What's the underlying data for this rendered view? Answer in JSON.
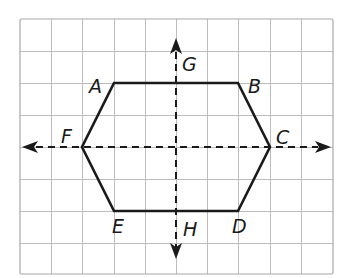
{
  "diagram": {
    "type": "hexagon-on-grid-with-lines-of-symmetry",
    "grid": {
      "columns": 10,
      "rows": 8,
      "line_color": "#b8b8b8",
      "outline_color": "#a0a0a0"
    },
    "hexagon": {
      "stroke_color": "#1a1a1a",
      "vertices": [
        {
          "name": "A",
          "x": 114,
          "y": 83
        },
        {
          "name": "B",
          "x": 238,
          "y": 83
        },
        {
          "name": "C",
          "x": 270,
          "y": 147
        },
        {
          "name": "D",
          "x": 238,
          "y": 211
        },
        {
          "name": "E",
          "x": 114,
          "y": 211
        },
        {
          "name": "F",
          "x": 82,
          "y": 147
        }
      ]
    },
    "lines": [
      {
        "name": "GH",
        "orientation": "vertical",
        "style": "dashed",
        "arrows": "both"
      },
      {
        "name": "FC",
        "orientation": "horizontal",
        "style": "dashed",
        "arrows": "both"
      }
    ],
    "labels": {
      "A": "A",
      "B": "B",
      "C": "C",
      "D": "D",
      "E": "E",
      "F": "F",
      "G": "G",
      "H": "H"
    }
  }
}
